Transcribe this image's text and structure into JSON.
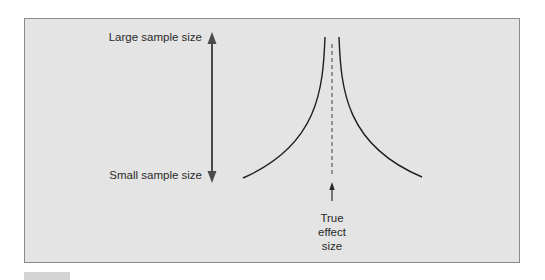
{
  "diagram": {
    "type": "funnel-plot-schematic",
    "labels": {
      "large_sample": "Large sample size",
      "small_sample": "Small sample size",
      "true_effect_line1": "True",
      "true_effect_line2": "effect",
      "true_effect_line3": "size"
    },
    "colors": {
      "panel_background": "#e4e4e4",
      "panel_border": "#8a8a8a",
      "curve": "#1e1e1e",
      "axis_arrow": "#4a4a4a",
      "dashed_line": "#5a5a5a",
      "text": "#2a2a2a"
    }
  }
}
